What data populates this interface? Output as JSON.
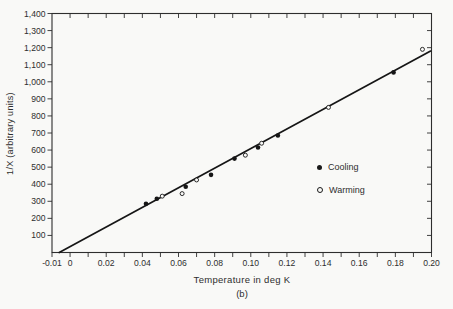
{
  "page": {
    "background": "#f9f9f7",
    "ink": "#2e2e2e",
    "plot_line_color": "#161616"
  },
  "chart_data": {
    "type": "scatter",
    "title": "",
    "figure_caption": "(b)",
    "grid": false,
    "frame": "full-box",
    "x_axis": {
      "label": "Temperature in deg K",
      "range": [
        -0.01,
        0.2
      ],
      "minor_tick_interval": 0.01,
      "labeled_ticks": [
        {
          "value": -0.01,
          "label": "-0.01"
        },
        {
          "value": 0,
          "label": "0"
        },
        {
          "value": 0.02,
          "label": "0.02"
        },
        {
          "value": 0.04,
          "label": "0.04"
        },
        {
          "value": 0.06,
          "label": "0.06"
        },
        {
          "value": 0.08,
          "label": "0.08"
        },
        {
          "value": 0.1,
          "label": "0.10"
        },
        {
          "value": 0.12,
          "label": "0.12"
        },
        {
          "value": 0.14,
          "label": "0.14"
        },
        {
          "value": 0.16,
          "label": "0.16"
        },
        {
          "value": 0.18,
          "label": "0.18"
        },
        {
          "value": 0.2,
          "label": "0.20"
        }
      ]
    },
    "y_axis": {
      "label": "1/X (arbitrary units)",
      "range": [
        0,
        1400
      ],
      "minor_tick_interval": 100,
      "labeled_ticks": [
        {
          "value": 100,
          "label": "100"
        },
        {
          "value": 200,
          "label": "200"
        },
        {
          "value": 300,
          "label": "300"
        },
        {
          "value": 400,
          "label": "400"
        },
        {
          "value": 500,
          "label": "500"
        },
        {
          "value": 600,
          "label": "600"
        },
        {
          "value": 700,
          "label": "700"
        },
        {
          "value": 800,
          "label": "800"
        },
        {
          "value": 900,
          "label": "900"
        },
        {
          "value": 1000,
          "label": "1,000"
        },
        {
          "value": 1100,
          "label": "1,100"
        },
        {
          "value": 1200,
          "label": "1,200"
        },
        {
          "value": 1300,
          "label": "1,300"
        },
        {
          "value": 1400,
          "label": "1,400"
        }
      ]
    },
    "series": [
      {
        "name": "Cooling",
        "marker": "filled-circle",
        "points": [
          [
            0.042,
            285
          ],
          [
            0.048,
            315
          ],
          [
            0.064,
            385
          ],
          [
            0.078,
            455
          ],
          [
            0.091,
            550
          ],
          [
            0.104,
            615
          ],
          [
            0.115,
            685
          ],
          [
            0.179,
            1055
          ]
        ]
      },
      {
        "name": "Warming",
        "marker": "open-circle",
        "points": [
          [
            0.051,
            330
          ],
          [
            0.062,
            345
          ],
          [
            0.07,
            425
          ],
          [
            0.097,
            570
          ],
          [
            0.106,
            640
          ],
          [
            0.143,
            850
          ],
          [
            0.195,
            1190
          ]
        ]
      }
    ],
    "fit_line": {
      "x1": -0.006,
      "y1": 0,
      "x2": 0.1995,
      "y2": 1180
    },
    "legend": {
      "position": "right-middle",
      "entries": [
        {
          "marker": "filled-circle",
          "label": "Cooling"
        },
        {
          "marker": "open-circle",
          "label": "Warming"
        }
      ]
    }
  }
}
